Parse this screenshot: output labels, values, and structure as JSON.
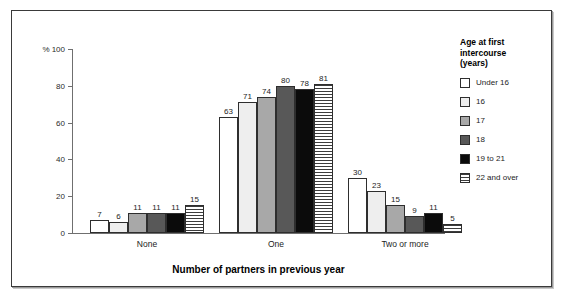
{
  "chart_data": {
    "type": "bar",
    "title": "",
    "xlabel": "Number of partners in previous year",
    "ylabel": "%",
    "ylim": [
      0,
      100
    ],
    "yticks": [
      0,
      20,
      40,
      60,
      80,
      100
    ],
    "ytick_labels": [
      "0",
      "20",
      "40",
      "60",
      "80",
      "100"
    ],
    "y_unit_prefix": "%",
    "grid": false,
    "legend_position": "right",
    "legend_title": "Age at first intercourse (years)",
    "categories": [
      "None",
      "One",
      "Two or more"
    ],
    "series": [
      {
        "name": "Under 16",
        "fill": "white",
        "values": [
          7,
          63,
          30
        ]
      },
      {
        "name": "16",
        "fill": "offwhite",
        "values": [
          6,
          71,
          23
        ]
      },
      {
        "name": "17",
        "fill": "mid",
        "values": [
          11,
          74,
          15
        ]
      },
      {
        "name": "18",
        "fill": "dark",
        "values": [
          11,
          80,
          9
        ]
      },
      {
        "name": "19 to 21",
        "fill": "black",
        "values": [
          11,
          78,
          11
        ]
      },
      {
        "name": "22 and over",
        "fill": "stripe",
        "values": [
          15,
          81,
          5
        ]
      }
    ]
  },
  "legend": {
    "title_lines": [
      "Age at first",
      "intercourse",
      "(years)"
    ],
    "items": [
      {
        "label": "Under 16",
        "swatch": "white"
      },
      {
        "label": "16",
        "swatch": "offwhite"
      },
      {
        "label": "17",
        "swatch": "mid"
      },
      {
        "label": "18",
        "swatch": "dark"
      },
      {
        "label": "19 to 21",
        "swatch": "black"
      },
      {
        "label": "22 and over",
        "swatch": "stripe"
      }
    ]
  },
  "colors": {
    "white": "#ffffff",
    "offwhite": "#eeeeee",
    "mid": "#a8a8a8",
    "dark": "#585858",
    "black": "#0b0b0b",
    "outline": "#2e2e2e",
    "axis": "#6f6f6f",
    "frame": "#3a3a3a"
  }
}
